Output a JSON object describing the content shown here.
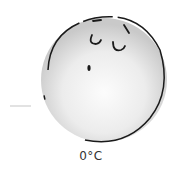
{
  "illustration": {
    "subject": "snowball-face",
    "ball_fill": "#e6e6e6",
    "ball_highlight": "#fafafa",
    "outline_color": "#1a1a1a",
    "dash_color": "#cccccc"
  },
  "caption": {
    "temperature": "0°C"
  }
}
